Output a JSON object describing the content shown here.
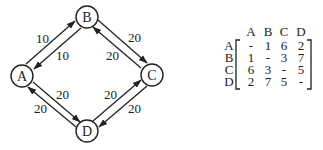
{
  "graph": {
    "nodes": [
      {
        "id": "A",
        "label": "A",
        "x": 22,
        "y": 76
      },
      {
        "id": "B",
        "label": "B",
        "x": 87,
        "y": 17
      },
      {
        "id": "C",
        "label": "C",
        "x": 152,
        "y": 75
      },
      {
        "id": "D",
        "label": "D",
        "x": 87,
        "y": 131
      }
    ],
    "edges": [
      {
        "from": "A",
        "to": "B",
        "weight": "10"
      },
      {
        "from": "B",
        "to": "A",
        "weight": "10"
      },
      {
        "from": "B",
        "to": "C",
        "weight": "20"
      },
      {
        "from": "C",
        "to": "B",
        "weight": "20"
      },
      {
        "from": "A",
        "to": "D",
        "weight": "20"
      },
      {
        "from": "D",
        "to": "A",
        "weight": "20"
      },
      {
        "from": "D",
        "to": "C",
        "weight": "20"
      },
      {
        "from": "C",
        "to": "D",
        "weight": "20"
      }
    ]
  },
  "matrix": {
    "col_headers": [
      "A",
      "B",
      "C",
      "D"
    ],
    "row_headers": [
      "A",
      "B",
      "C",
      "D"
    ],
    "rows": [
      [
        "-",
        "1",
        "6",
        "2"
      ],
      [
        "1",
        "-",
        "3",
        "7"
      ],
      [
        "6",
        "3",
        "-",
        "5"
      ],
      [
        "2",
        "7",
        "5",
        "-"
      ]
    ]
  }
}
